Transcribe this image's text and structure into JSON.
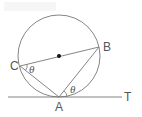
{
  "diagram": {
    "type": "geometry",
    "colors": {
      "stroke": "#777777",
      "text": "#555555",
      "center_dot": "#111111"
    },
    "circle": {
      "cx": 59,
      "cy": 56,
      "r": 41
    },
    "points": {
      "A": {
        "label": "A",
        "x": 59,
        "y": 97
      },
      "B": {
        "label": "B",
        "x": 99,
        "y": 47
      },
      "C": {
        "label": "C",
        "x": 20,
        "y": 66
      },
      "T": {
        "label": "T"
      },
      "O": {
        "x": 59,
        "y": 56
      }
    },
    "angles": [
      {
        "at": "C",
        "label": "θ"
      },
      {
        "at": "A",
        "label": "θ"
      }
    ]
  }
}
